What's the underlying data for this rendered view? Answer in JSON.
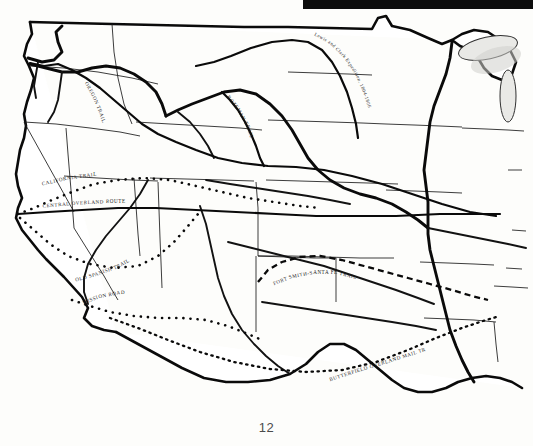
{
  "document": {
    "page_number": "12",
    "figure_kind": "historical-line-map",
    "region": "Western United States"
  },
  "artifact": {
    "top_bar_label": "scan-edge-bar"
  },
  "trails": [
    {
      "id": "lewis-clark",
      "label": "Lewis and Clark Expedition, 1804-1806",
      "style": "solid",
      "path": "M 196 66 L 214 62 L 231 56 L 251 48 L 272 42 L 292 40 L 308 42 L 322 50 L 332 62 L 340 76 L 347 92 L 352 108 L 356 124 L 358 138"
    },
    {
      "id": "oregon-trail",
      "label": "OREGON TRAIL",
      "style": "solid",
      "path": "M 30 63 L 52 67 L 74 72 L 96 80 L 118 95 L 138 112 L 158 130 L 180 146 L 206 158 L 236 164 L 268 166 L 300 168 L 334 172 L 370 180 L 404 192 L 440 204 L 472 212 L 496 216"
    },
    {
      "id": "bozeman-trail",
      "label": "BOZEMAN TRAIL",
      "style": "solid",
      "path": "M 222 92 L 234 100 L 244 112 L 252 126 L 258 140 L 262 152 L 266 164"
    },
    {
      "id": "california-trail",
      "label": "CALIFORNIA TRAIL",
      "style": "beaded",
      "path": "M 18 214 L 40 206 L 62 196 L 86 186 L 112 180 L 140 178 L 170 180 L 200 186 L 230 194 L 258 200 L 286 204 L 312 208"
    },
    {
      "id": "central-overland-route",
      "label": "CENTRAL OVERLAND ROUTE",
      "style": "solid",
      "path": "M 18 214 L 48 212 L 82 210 L 118 208 L 156 208 L 196 210 L 236 212 L 276 214 L 316 216 L 356 216 L 396 216 L 440 214 L 480 214 L 500 214"
    },
    {
      "id": "old-spanish-trail",
      "label": "OLD SPANISH TRAIL",
      "style": "beaded",
      "path": "M 20 218 L 36 232 L 52 246 L 70 258 L 92 266 L 116 270 L 140 268 L 160 258 L 176 244 L 190 228 L 200 216"
    },
    {
      "id": "mission-road",
      "label": "MISSION ROAD",
      "style": "beaded",
      "path": "M 72 300 L 92 306 L 114 312 L 138 316 L 162 318 L 186 318 L 210 320 L 232 326 L 252 334"
    },
    {
      "id": "fort-smith-santa-fe-trail",
      "label": "FORT SMITH-SANTA FE TRAIL",
      "style": "dashed",
      "path": "M 258 282 L 272 270 L 288 262 L 306 258 L 326 258 L 348 262 L 370 268 L 392 274 L 414 280 L 436 286 L 458 292 L 476 298"
    },
    {
      "id": "butterfield-overland-mail-trail",
      "label": "BUTTERFIELD OVERLAND MAIL TRAIL",
      "style": "dotted",
      "path": "M 110 318 L 140 330 L 172 342 L 206 354 L 242 364 L 280 370 L 318 372 L 354 368 L 388 360 L 420 348 L 448 336 L 472 326 L 492 318"
    }
  ],
  "labels": {
    "lewis_clark": "Lewis and Clark Expedition, 1804-1806",
    "oregon": "OREGON TRAIL",
    "bozeman": "BOZEMAN TRAIL",
    "california": "CALIFORNIA TRAIL",
    "central_overland": "CENTRAL OVERLAND ROUTE",
    "old_spanish": "OLD SPANISH TRAIL",
    "mission_road": "MISSION ROAD",
    "fort_smith": "FORT SMITH-SANTA FE TRAIL",
    "butterfield": "BUTTERFIELD OVERLAND MAIL TRAIL"
  }
}
